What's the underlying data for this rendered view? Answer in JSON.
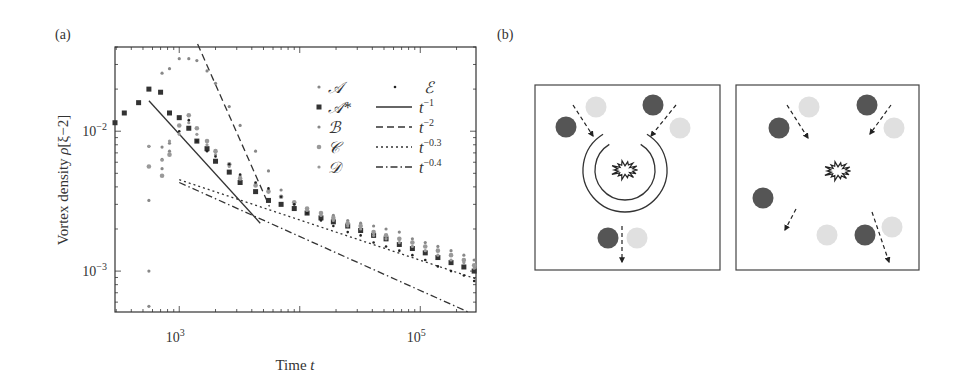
{
  "panels": {
    "a": {
      "label": "(a)"
    },
    "b": {
      "label": "(b)"
    }
  },
  "chart_data": {
    "type": "scatter",
    "title": "",
    "xlabel": "Time t",
    "ylabel": "Vortex density ρ[ξ−2]",
    "xscale": "log",
    "yscale": "log",
    "xlim": [
      293,
      290000
    ],
    "ylim": [
      0.00051,
      0.04
    ],
    "x_ticks": [
      {
        "value": 1000,
        "label": "10^3"
      },
      {
        "value": 100000,
        "label": "10^5"
      }
    ],
    "y_ticks": [
      {
        "value": 0.01,
        "label": "10^-2"
      },
      {
        "value": 0.001,
        "label": "10^-3"
      }
    ],
    "grid": false,
    "legend_position": "upper right",
    "series": [
      {
        "name": "A",
        "label": "𝒜",
        "marker": "small-dot",
        "color": "#888888",
        "points": [
          [
            560,
            0.00056
          ],
          [
            560,
            0.001
          ],
          [
            560,
            0.0032
          ],
          [
            560,
            0.0078
          ],
          [
            720,
            0.0054
          ],
          [
            720,
            0.0063
          ],
          [
            720,
            0.0077
          ],
          [
            830,
            0.0082
          ],
          [
            830,
            0.0072
          ]
        ]
      },
      {
        "name": "A*",
        "label": "𝒜*",
        "marker": "square",
        "color": "#333333",
        "points": [
          [
            293,
            0.0115
          ],
          [
            350,
            0.0135
          ],
          [
            460,
            0.016
          ],
          [
            560,
            0.02
          ],
          [
            700,
            0.019
          ],
          [
            830,
            0.0135
          ],
          [
            1000,
            0.0125
          ],
          [
            1200,
            0.0105
          ],
          [
            1400,
            0.0085
          ],
          [
            1700,
            0.0075
          ],
          [
            2000,
            0.0061
          ],
          [
            2600,
            0.0051
          ],
          [
            3200,
            0.0043
          ],
          [
            4300,
            0.0037
          ],
          [
            5500,
            0.0032
          ],
          [
            7000,
            0.003
          ],
          [
            9000,
            0.0028
          ],
          [
            11500,
            0.0026
          ],
          [
            15000,
            0.0024
          ],
          [
            19000,
            0.00225
          ],
          [
            25000,
            0.0021
          ],
          [
            32000,
            0.00195
          ],
          [
            41000,
            0.0018
          ],
          [
            52000,
            0.0017
          ],
          [
            67000,
            0.00155
          ],
          [
            86000,
            0.00145
          ],
          [
            110000,
            0.00135
          ],
          [
            140000,
            0.00125
          ],
          [
            180000,
            0.00115
          ],
          [
            230000,
            0.00107
          ],
          [
            280000,
            0.001
          ]
        ]
      },
      {
        "name": "B",
        "label": "ℬ",
        "marker": "small-dot",
        "color": "#888888",
        "points": [
          [
            720,
            0.026
          ],
          [
            830,
            0.028
          ],
          [
            1000,
            0.033
          ],
          [
            1200,
            0.033
          ],
          [
            1400,
            0.032
          ],
          [
            1700,
            0.027
          ],
          [
            2000,
            0.022
          ],
          [
            2600,
            0.015
          ],
          [
            3200,
            0.011
          ],
          [
            4300,
            0.0072
          ],
          [
            5500,
            0.0052
          ],
          [
            7000,
            0.0038
          ],
          [
            9000,
            0.0031
          ],
          [
            11500,
            0.0028
          ],
          [
            15000,
            0.0026
          ],
          [
            19000,
            0.0025
          ],
          [
            25000,
            0.0023
          ],
          [
            32000,
            0.0022
          ],
          [
            41000,
            0.0021
          ],
          [
            52000,
            0.002
          ],
          [
            67000,
            0.0019
          ],
          [
            86000,
            0.0017
          ],
          [
            110000,
            0.0016
          ],
          [
            140000,
            0.0015
          ],
          [
            180000,
            0.0014
          ],
          [
            230000,
            0.0013
          ],
          [
            280000,
            0.0012
          ]
        ]
      },
      {
        "name": "C",
        "label": "𝒞",
        "marker": "dot",
        "color": "#999999",
        "points": [
          [
            560,
            0.0056
          ],
          [
            720,
            0.0048
          ],
          [
            830,
            0.0068
          ],
          [
            1000,
            0.011
          ],
          [
            1200,
            0.013
          ],
          [
            1400,
            0.0105
          ],
          [
            1700,
            0.0085
          ],
          [
            2000,
            0.0072
          ],
          [
            2600,
            0.0058
          ],
          [
            3200,
            0.0046
          ],
          [
            4300,
            0.0041
          ],
          [
            5500,
            0.0037
          ],
          [
            7000,
            0.0034
          ],
          [
            9000,
            0.0031
          ],
          [
            11500,
            0.0028
          ],
          [
            15000,
            0.0026
          ],
          [
            19000,
            0.0024
          ],
          [
            25000,
            0.0022
          ],
          [
            32000,
            0.0021
          ],
          [
            41000,
            0.0019
          ],
          [
            52000,
            0.0018
          ],
          [
            67000,
            0.0017
          ],
          [
            86000,
            0.0016
          ],
          [
            110000,
            0.0015
          ],
          [
            140000,
            0.0014
          ],
          [
            180000,
            0.0013
          ],
          [
            230000,
            0.0012
          ],
          [
            280000,
            0.0011
          ]
        ]
      },
      {
        "name": "D",
        "label": "𝒟",
        "marker": "small-dot",
        "color": "#999999",
        "points": [
          [
            560,
            0.0078
          ],
          [
            720,
            0.0062
          ],
          [
            830,
            0.0085
          ],
          [
            1000,
            0.0095
          ],
          [
            1200,
            0.0115
          ],
          [
            1400,
            0.0095
          ],
          [
            1700,
            0.008
          ],
          [
            2000,
            0.0068
          ],
          [
            2600,
            0.0056
          ],
          [
            3200,
            0.0048
          ],
          [
            4300,
            0.0042
          ],
          [
            5500,
            0.0038
          ],
          [
            7000,
            0.0034
          ],
          [
            9000,
            0.003
          ],
          [
            11500,
            0.0027
          ],
          [
            15000,
            0.0025
          ],
          [
            19000,
            0.0023
          ],
          [
            25000,
            0.0021
          ],
          [
            32000,
            0.002
          ],
          [
            41000,
            0.0018
          ],
          [
            52000,
            0.0017
          ],
          [
            67000,
            0.0016
          ],
          [
            86000,
            0.0015
          ],
          [
            110000,
            0.0014
          ],
          [
            140000,
            0.0013
          ],
          [
            180000,
            0.0012
          ],
          [
            230000,
            0.00115
          ],
          [
            280000,
            0.00105
          ]
        ]
      },
      {
        "name": "E",
        "label": "ℰ",
        "marker": "tiny-dot",
        "color": "#222222",
        "points": [
          [
            1000,
            0.01
          ],
          [
            1200,
            0.012
          ],
          [
            1400,
            0.0085
          ],
          [
            1700,
            0.0072
          ],
          [
            2000,
            0.0066
          ],
          [
            2600,
            0.0058
          ],
          [
            3200,
            0.0049
          ],
          [
            4300,
            0.0043
          ],
          [
            5500,
            0.0039
          ],
          [
            7000,
            0.0034
          ],
          [
            9000,
            0.003
          ],
          [
            11500,
            0.0026
          ],
          [
            15000,
            0.0023
          ],
          [
            19000,
            0.0021
          ],
          [
            25000,
            0.0019
          ],
          [
            32000,
            0.0018
          ],
          [
            41000,
            0.0016
          ],
          [
            52000,
            0.0015
          ],
          [
            67000,
            0.0014
          ],
          [
            86000,
            0.0013
          ],
          [
            110000,
            0.0012
          ],
          [
            140000,
            0.00108
          ],
          [
            180000,
            0.001
          ],
          [
            230000,
            0.00093
          ],
          [
            280000,
            0.00085
          ]
        ]
      }
    ],
    "reference_lines": [
      {
        "name": "t^-1",
        "label_base": "t",
        "label_exp": "−1",
        "style": "solid",
        "from": [
          560,
          0.0165
        ],
        "to": [
          4700,
          0.0022
        ]
      },
      {
        "name": "t^-2",
        "label_base": "t",
        "label_exp": "−2",
        "style": "dashed",
        "from": [
          1420,
          0.042
        ],
        "to": [
          5600,
          0.0029
        ]
      },
      {
        "name": "t^-0.3",
        "label_base": "t",
        "label_exp": "−0.3",
        "style": "dotted",
        "from": [
          1000,
          0.0045
        ],
        "to": [
          290000,
          0.00088
        ]
      },
      {
        "name": "t^-0.4",
        "label_base": "t",
        "label_exp": "−0.4",
        "style": "dashdot",
        "from": [
          1000,
          0.0043
        ],
        "to": [
          250000,
          0.00051
        ]
      }
    ]
  },
  "diagram_b": {
    "boxes": [
      {
        "name": "left-box",
        "x": 535,
        "y": 85,
        "w": 185,
        "h": 185,
        "dark_vortices": [
          [
            566,
            127
          ],
          [
            653,
            105
          ],
          [
            608,
            238
          ]
        ],
        "light_vortices": [
          [
            596,
            107
          ],
          [
            680,
            128
          ],
          [
            637,
            238
          ]
        ],
        "arrows": [
          [
            573,
            105,
            593,
            136
          ],
          [
            676,
            105,
            651,
            136
          ],
          [
            622,
            226,
            622,
            262
          ]
        ],
        "explosion_center": [
          625,
          170
        ],
        "rings": [
          {
            "r": 30,
            "gap": true
          },
          {
            "r": 42,
            "gap": true
          }
        ]
      },
      {
        "name": "right-box",
        "x": 736,
        "y": 85,
        "w": 183,
        "h": 185,
        "dark_vortices": [
          [
            779,
            128
          ],
          [
            867,
            105
          ],
          [
            763,
            198
          ],
          [
            865,
            235
          ]
        ],
        "light_vortices": [
          [
            809,
            107
          ],
          [
            894,
            128
          ],
          [
            827,
            235
          ],
          [
            892,
            227
          ]
        ],
        "arrows": [
          [
            787,
            105,
            808,
            138
          ],
          [
            891,
            105,
            870,
            134
          ],
          [
            796,
            209,
            785,
            230
          ],
          [
            872,
            212,
            889,
            262
          ]
        ],
        "explosion_center": [
          838,
          171
        ]
      }
    ],
    "colors": {
      "dark": "#555555",
      "light": "#e0e0e0"
    }
  }
}
